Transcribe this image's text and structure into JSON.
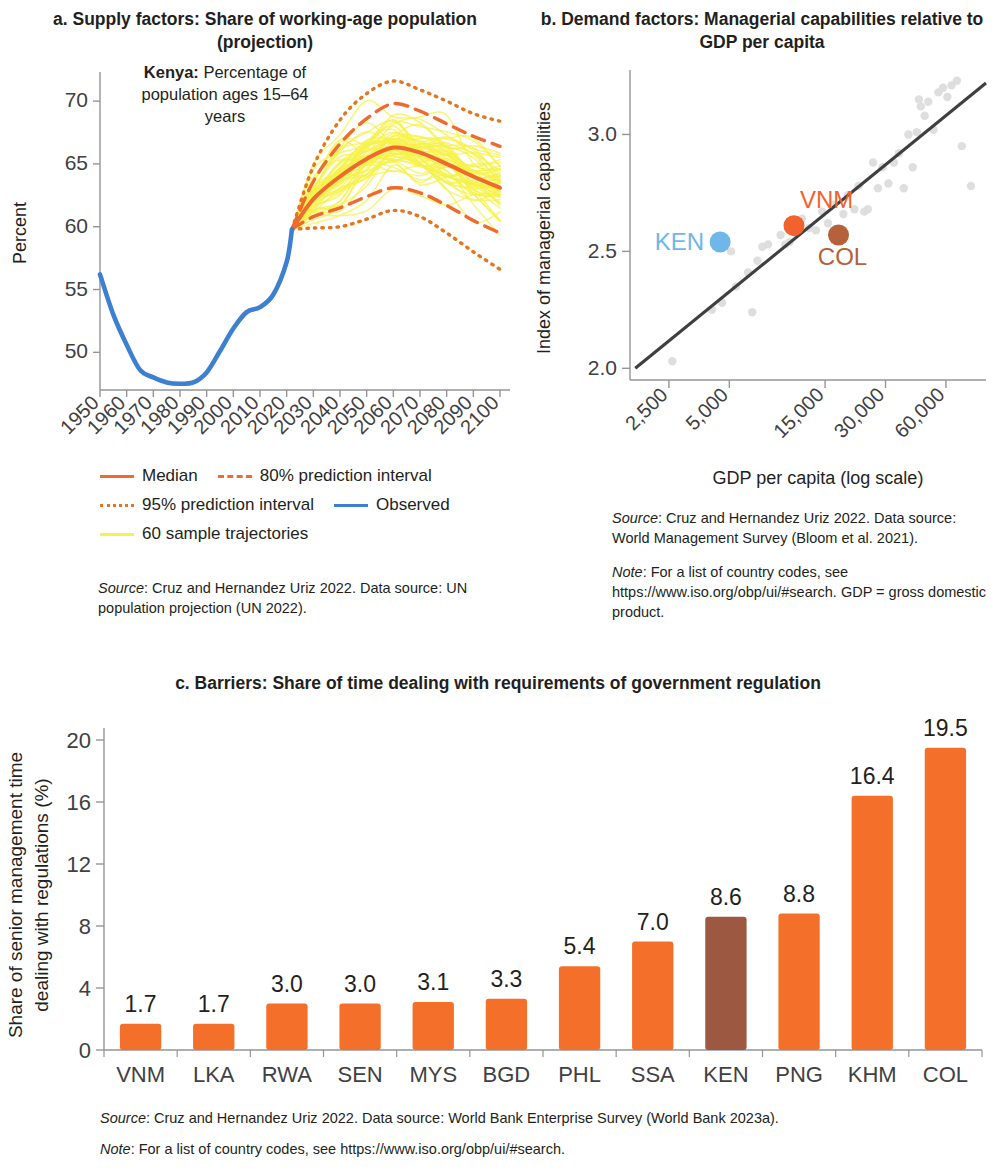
{
  "colors": {
    "orange": "#ee6a2e",
    "orange_bright": "#f2622e",
    "orange_dot": "#e3761f",
    "blue": "#3d7fd0",
    "light_blue": "#6fb7e8",
    "yellow": "#f6f24b",
    "brown": "#9c5840",
    "col_brown": "#b5623c",
    "axis": "#939598",
    "text": "#231f20",
    "scatter_grey": "#dcdcdc",
    "fitline": "#3f3f3f"
  },
  "panel_a": {
    "title": "a. Supply factors: Share of working-age population (projection)",
    "annotation_bold": "Kenya:",
    "annotation_rest": " Percentage of population ages 15–64 years",
    "legend": [
      {
        "label": "Median",
        "style": "solid",
        "color": "#ee6a2e"
      },
      {
        "label": "80% prediction interval",
        "style": "dashed",
        "color": "#ee6a2e"
      },
      {
        "label": "95% prediction interval",
        "style": "dotted",
        "color": "#e3761f"
      },
      {
        "label": "Observed",
        "style": "solid",
        "color": "#3d7fd0"
      },
      {
        "label": "60 sample trajectories",
        "style": "solid",
        "color": "#f6f24b"
      }
    ],
    "source_prefix": "Source",
    "source_text": ": Cruz and Hernandez Uriz 2022. Data source: UN population projection (UN 2022)."
  },
  "panel_b": {
    "title": "b. Demand factors: Managerial capabilities relative to GDP per capita",
    "labels": [
      {
        "code": "KEN",
        "color": "#6fb7e8"
      },
      {
        "code": "VNM",
        "color": "#f2622e"
      },
      {
        "code": "COL",
        "color": "#b5623c"
      }
    ],
    "source_prefix": "Source",
    "source_text": ": Cruz and Hernandez Uriz 2022. Data source: World Management Survey (Bloom et al. 2021).",
    "note_prefix": "Note",
    "note_text": ": For a list of country codes, see https://www.iso.org/obp/ui/#search. GDP = gross domestic product."
  },
  "panel_c": {
    "title": "c. Barriers: Share of time dealing with requirements of government regulation",
    "source_prefix": "Source",
    "source_text": ": Cruz and Hernandez Uriz 2022. Data source: World Bank Enterprise Survey (World Bank 2023a).",
    "note_prefix": "Note",
    "note_text": ": For a list of country codes, see https://www.iso.org/obp/ui/#search."
  },
  "chart_data": [
    {
      "id": "panel_a",
      "type": "line",
      "title": "a. Supply factors: Share of working-age population (projection)",
      "xlabel": "",
      "ylabel": "Percent",
      "xlim": [
        1950,
        2100
      ],
      "ylim": [
        47,
        72
      ],
      "yticks": [
        50,
        55,
        60,
        65,
        70
      ],
      "xticks": [
        1950,
        1960,
        1970,
        1980,
        1990,
        2000,
        2010,
        2020,
        2030,
        2040,
        2050,
        2060,
        2070,
        2080,
        2090,
        2100
      ],
      "grid": false,
      "legend_position": "below",
      "series": [
        {
          "name": "Observed",
          "color": "#3d7fd0",
          "style": "solid",
          "x": [
            1950,
            1955,
            1960,
            1965,
            1970,
            1975,
            1980,
            1985,
            1990,
            1995,
            2000,
            2005,
            2010,
            2015,
            2020,
            2022
          ],
          "values": [
            56.2,
            53.0,
            50.6,
            48.6,
            48.0,
            47.6,
            47.5,
            47.6,
            48.4,
            50.1,
            51.9,
            53.2,
            53.6,
            54.6,
            57.2,
            59.8
          ]
        },
        {
          "name": "Median",
          "color": "#ee6a2e",
          "style": "solid",
          "x": [
            2022,
            2030,
            2040,
            2050,
            2060,
            2070,
            2080,
            2090,
            2100
          ],
          "values": [
            59.8,
            62.2,
            64.0,
            65.4,
            66.3,
            65.9,
            65.0,
            64.0,
            63.1
          ]
        },
        {
          "name": "80% prediction interval upper",
          "color": "#ee6a2e",
          "style": "dashed",
          "x": [
            2022,
            2030,
            2040,
            2050,
            2060,
            2070,
            2080,
            2090,
            2100
          ],
          "values": [
            59.8,
            63.6,
            66.6,
            68.6,
            69.8,
            69.2,
            68.2,
            67.2,
            66.4
          ]
        },
        {
          "name": "80% prediction interval lower",
          "color": "#ee6a2e",
          "style": "dashed",
          "x": [
            2022,
            2030,
            2040,
            2050,
            2060,
            2070,
            2080,
            2090,
            2100
          ],
          "values": [
            59.8,
            60.8,
            61.5,
            62.4,
            63.1,
            62.7,
            61.7,
            60.5,
            59.5
          ]
        },
        {
          "name": "95% prediction interval upper",
          "color": "#e3761f",
          "style": "dotted",
          "x": [
            2022,
            2030,
            2040,
            2050,
            2060,
            2070,
            2080,
            2090,
            2100
          ],
          "values": [
            59.8,
            64.8,
            68.5,
            70.6,
            71.6,
            70.9,
            70.0,
            69.0,
            68.4
          ]
        },
        {
          "name": "95% prediction interval lower",
          "color": "#e3761f",
          "style": "dotted",
          "x": [
            2022,
            2030,
            2040,
            2050,
            2060,
            2070,
            2080,
            2090,
            2100
          ],
          "values": [
            59.8,
            59.9,
            60.0,
            60.6,
            61.3,
            60.8,
            59.5,
            58.0,
            56.6
          ]
        },
        {
          "name": "60 sample trajectories",
          "color": "#f6f24b",
          "style": "solid",
          "count": 60,
          "note": "bundle of stochastic projection paths spanning the 95% interval from 2022 to 2100"
        }
      ]
    },
    {
      "id": "panel_b",
      "type": "scatter",
      "title": "b. Demand factors: Managerial capabilities relative to GDP per capita",
      "xlabel": "GDP per capita (log scale)",
      "ylabel": "Index of managerial capabilities",
      "xscale": "log",
      "xticks": [
        2500,
        5000,
        15000,
        30000,
        60000
      ],
      "xtick_labels": [
        "2,500",
        "5,000",
        "15,000",
        "30,000",
        "60,000"
      ],
      "yticks": [
        2.0,
        2.5,
        3.0
      ],
      "ylim": [
        1.95,
        3.25
      ],
      "xlim": [
        1600,
        95000
      ],
      "grid": false,
      "fit_line": {
        "color": "#3f3f3f",
        "x": [
          1700,
          95000
        ],
        "y": [
          2.0,
          3.22
        ]
      },
      "highlighted": [
        {
          "code": "KEN",
          "x": 4500,
          "y": 2.54,
          "color": "#6fb7e8",
          "label_side": "left"
        },
        {
          "code": "VNM",
          "x": 10500,
          "y": 2.61,
          "color": "#f2622e",
          "label_side": "above"
        },
        {
          "code": "COL",
          "x": 17500,
          "y": 2.57,
          "color": "#b5623c",
          "label_side": "below"
        }
      ],
      "points": [
        {
          "x": 2600,
          "y": 2.03
        },
        {
          "x": 4100,
          "y": 2.25
        },
        {
          "x": 4600,
          "y": 2.28
        },
        {
          "x": 5400,
          "y": 2.35
        },
        {
          "x": 6200,
          "y": 2.41
        },
        {
          "x": 6500,
          "y": 2.24
        },
        {
          "x": 6900,
          "y": 2.46
        },
        {
          "x": 7300,
          "y": 2.52
        },
        {
          "x": 7800,
          "y": 2.53
        },
        {
          "x": 5100,
          "y": 2.5
        },
        {
          "x": 9000,
          "y": 2.57
        },
        {
          "x": 11500,
          "y": 2.64
        },
        {
          "x": 12500,
          "y": 2.6
        },
        {
          "x": 13500,
          "y": 2.59
        },
        {
          "x": 14500,
          "y": 2.67
        },
        {
          "x": 15500,
          "y": 2.62
        },
        {
          "x": 16500,
          "y": 2.7
        },
        {
          "x": 18500,
          "y": 2.66
        },
        {
          "x": 19500,
          "y": 2.74
        },
        {
          "x": 21000,
          "y": 2.68
        },
        {
          "x": 22000,
          "y": 2.78
        },
        {
          "x": 23500,
          "y": 2.67
        },
        {
          "x": 24500,
          "y": 2.68
        },
        {
          "x": 26000,
          "y": 2.88
        },
        {
          "x": 27500,
          "y": 2.77
        },
        {
          "x": 29000,
          "y": 2.86
        },
        {
          "x": 31000,
          "y": 2.79
        },
        {
          "x": 33000,
          "y": 2.88
        },
        {
          "x": 35000,
          "y": 2.92
        },
        {
          "x": 37000,
          "y": 2.77
        },
        {
          "x": 39000,
          "y": 3.0
        },
        {
          "x": 41000,
          "y": 2.86
        },
        {
          "x": 43000,
          "y": 3.01
        },
        {
          "x": 45000,
          "y": 3.12
        },
        {
          "x": 47000,
          "y": 3.08
        },
        {
          "x": 49000,
          "y": 3.14
        },
        {
          "x": 52000,
          "y": 3.02
        },
        {
          "x": 55000,
          "y": 3.18
        },
        {
          "x": 58000,
          "y": 3.2
        },
        {
          "x": 61000,
          "y": 3.16
        },
        {
          "x": 64000,
          "y": 3.21
        },
        {
          "x": 68000,
          "y": 3.23
        },
        {
          "x": 72000,
          "y": 2.95
        },
        {
          "x": 80000,
          "y": 2.78
        },
        {
          "x": 44000,
          "y": 3.15
        },
        {
          "x": 9500,
          "y": 2.53
        },
        {
          "x": 10000,
          "y": 2.54
        }
      ]
    },
    {
      "id": "panel_c",
      "type": "bar",
      "title": "c. Barriers: Share of time dealing with requirements of government regulation",
      "xlabel": "",
      "ylabel": "Share of senior management time dealing with regulations (%)",
      "categories": [
        "VNM",
        "LKA",
        "RWA",
        "SEN",
        "MYS",
        "BGD",
        "PHL",
        "SSA",
        "KEN",
        "PNG",
        "KHM",
        "COL"
      ],
      "values": [
        1.7,
        1.7,
        3.0,
        3.0,
        3.1,
        3.3,
        5.4,
        7.0,
        8.6,
        8.8,
        16.4,
        19.5
      ],
      "value_labels": [
        "1.7",
        "1.7",
        "3.0",
        "3.0",
        "3.1",
        "3.3",
        "5.4",
        "7.0",
        "8.6",
        "8.8",
        "16.4",
        "19.5"
      ],
      "bar_colors": [
        "#f4702a",
        "#f4702a",
        "#f4702a",
        "#f4702a",
        "#f4702a",
        "#f4702a",
        "#f4702a",
        "#f4702a",
        "#9c5840",
        "#f4702a",
        "#f4702a",
        "#f4702a"
      ],
      "highlight_index": 8,
      "yticks": [
        0,
        4,
        8,
        12,
        16,
        20
      ],
      "ylim": [
        0,
        20
      ],
      "grid": false
    }
  ]
}
